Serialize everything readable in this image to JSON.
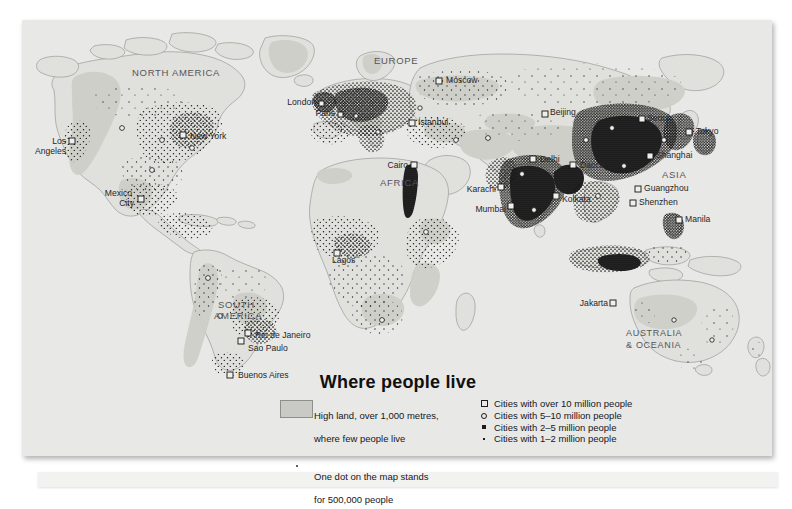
{
  "page": {
    "title": "Where people live",
    "background_color": "#e8e8e6",
    "ink_color": "#1c1c1c"
  },
  "map": {
    "projection_note": "world map, equal-area style",
    "land_fill": "#e0e0dc",
    "highland_fill": "#cfcfc9",
    "coast_stroke": "#9a9a96",
    "region_labels": [
      {
        "name": "NORTH AMERICA",
        "x": 170,
        "y": 53,
        "size": 9.5,
        "letter_spacing": 0.6
      },
      {
        "name": "SOUTH AMERICA",
        "x": 208,
        "y": 291,
        "size": 9.5,
        "letter_spacing": 0.6,
        "line2": "AMERICA"
      },
      {
        "name": "EUROPE",
        "x": 385,
        "y": 44,
        "size": 9.5,
        "letter_spacing": 0.6
      },
      {
        "name": "AFRICA",
        "x": 382,
        "y": 165,
        "size": 9.5,
        "letter_spacing": 0.6
      },
      {
        "name": "ASIA",
        "x": 657,
        "y": 160,
        "size": 9.5,
        "letter_spacing": 0.6
      },
      {
        "name": "AUSTRALIA",
        "x": 640,
        "y": 316,
        "size": 9,
        "letter_spacing": 0.6
      },
      {
        "name": "& OCEANIA",
        "x": 640,
        "y": 328,
        "size": 9,
        "letter_spacing": 0.6
      }
    ],
    "city_labels": [
      {
        "name": "Los Angeles",
        "x": 54,
        "y": 123,
        "anchor": "end",
        "line2": "Angeles"
      },
      {
        "name": "New York",
        "x": 166,
        "y": 116,
        "anchor": "start"
      },
      {
        "name": "Mexico",
        "x": 96,
        "y": 181,
        "anchor": "end",
        "line2": "City"
      },
      {
        "name": "Rio de Janeiro",
        "x": 229,
        "y": 316,
        "anchor": "start"
      },
      {
        "name": "Sao Paulo",
        "x": 216,
        "y": 331,
        "anchor": "start"
      },
      {
        "name": "Buenos Aires",
        "x": 216,
        "y": 358,
        "anchor": "start"
      },
      {
        "name": "London",
        "x": 307,
        "y": 86,
        "anchor": "end"
      },
      {
        "name": "Paris",
        "x": 314,
        "y": 96,
        "anchor": "end"
      },
      {
        "name": "Moscow",
        "x": 424,
        "y": 63,
        "anchor": "start"
      },
      {
        "name": "Istanbul",
        "x": 397,
        "y": 105,
        "anchor": "start"
      },
      {
        "name": "Cairo",
        "x": 388,
        "y": 148,
        "anchor": "end"
      },
      {
        "name": "Lagos",
        "x": 320,
        "y": 236,
        "anchor": "start"
      },
      {
        "name": "Karachi",
        "x": 484,
        "y": 169,
        "anchor": "start"
      },
      {
        "name": "Mumbai",
        "x": 480,
        "y": 188,
        "anchor": "start"
      },
      {
        "name": "Delhi",
        "x": 517,
        "y": 140,
        "anchor": "start"
      },
      {
        "name": "Dacca",
        "x": 556,
        "y": 146,
        "anchor": "start"
      },
      {
        "name": "Kolkata",
        "x": 540,
        "y": 178,
        "anchor": "start"
      },
      {
        "name": "Beijing",
        "x": 529,
        "y": 95,
        "anchor": "start"
      },
      {
        "name": "Seoul",
        "x": 625,
        "y": 100,
        "anchor": "start"
      },
      {
        "name": "Tokyo",
        "x": 674,
        "y": 113,
        "anchor": "start"
      },
      {
        "name": "Shanghai",
        "x": 634,
        "y": 137,
        "anchor": "start"
      },
      {
        "name": "Guangzhou",
        "x": 622,
        "y": 170,
        "anchor": "start"
      },
      {
        "name": "Shenzhen",
        "x": 617,
        "y": 184,
        "anchor": "start"
      },
      {
        "name": "Manila",
        "x": 663,
        "y": 201,
        "anchor": "start"
      },
      {
        "name": "Jakarta",
        "x": 596,
        "y": 285,
        "anchor": "end"
      }
    ]
  },
  "legend": {
    "highland": {
      "swatch_color": "#c9c9c5",
      "line1": "High land, over 1,000 metres,",
      "line2": "where few people live"
    },
    "dot": {
      "line1": "One dot on the map stands",
      "line2": "for 500,000 people"
    },
    "cities": [
      {
        "marker": "large-open-square",
        "label": "Cities with over 10 million people"
      },
      {
        "marker": "open-circle",
        "label": "Cities with 5–10 million people"
      },
      {
        "marker": "filled-square",
        "label": "Cities with 2–5 million people"
      },
      {
        "marker": "small-filled-square",
        "label": "Cities with 1–2 million people"
      }
    ]
  }
}
